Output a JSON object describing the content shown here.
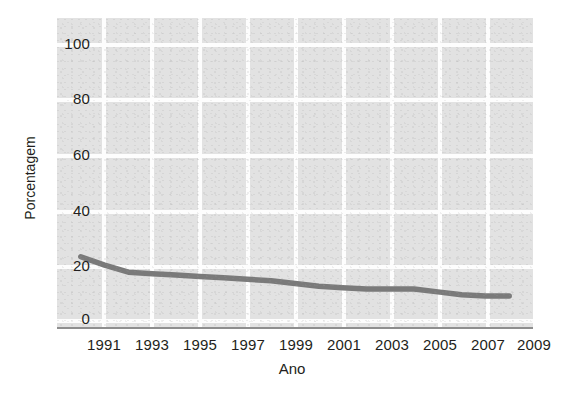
{
  "chart_data": {
    "type": "line",
    "title": "",
    "xlabel": "Ano",
    "ylabel": "Porcentagem",
    "x": [
      1991,
      1992,
      1993,
      1994,
      1995,
      1996,
      1997,
      1998,
      1999,
      2000,
      2001,
      2002,
      2003,
      2004,
      2005,
      2006,
      2007,
      2008,
      2009
    ],
    "values": [
      25,
      22,
      19.5,
      19,
      18.5,
      18,
      17.5,
      17,
      16.5,
      15.5,
      14.5,
      14,
      13.5,
      13.5,
      13.5,
      12.5,
      11.5,
      11,
      11
    ],
    "series": [
      {
        "name": "Porcentagem",
        "color": "#7a7a7a",
        "values": [
          25,
          22,
          19.5,
          19,
          18.5,
          18,
          17.5,
          17,
          16.5,
          15.5,
          14.5,
          14,
          13.5,
          13.5,
          13.5,
          12.5,
          11.5,
          11,
          11
        ]
      }
    ],
    "xlim": [
      1990,
      2010
    ],
    "ylim": [
      0,
      110
    ],
    "xticks": [
      "1991",
      "1993",
      "1995",
      "1997",
      "1999",
      "2001",
      "2003",
      "2005",
      "2007",
      "2009"
    ],
    "yticks": [
      "0",
      "20",
      "40",
      "60",
      "80",
      "100"
    ],
    "grid": true,
    "grid_color": "#fdfdfd",
    "plot_background": "#e2e2e2",
    "legend": "none"
  },
  "axes": {
    "y_title": "Porcentagem",
    "x_title": "Ano"
  }
}
